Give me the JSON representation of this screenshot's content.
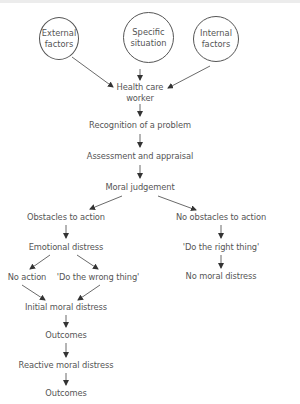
{
  "diagram": {
    "type": "flowchart",
    "colors": {
      "text": "#555555",
      "arrow": "#333333",
      "circle_border": "#555555"
    },
    "input_circles": [
      {
        "id": "external",
        "line1": "External",
        "line2": "factors"
      },
      {
        "id": "specific",
        "line1": "Specific",
        "line2": "situation"
      },
      {
        "id": "internal",
        "line1": "Internal",
        "line2": "factors"
      }
    ],
    "nodes": {
      "health_care_worker": {
        "line1": "Health care",
        "line2": "worker"
      },
      "recognition": "Recognition of a problem",
      "assessment": "Assessment and appraisal",
      "moral_judgement": "Moral judgement",
      "obstacles": "Obstacles to action",
      "no_obstacles": "No obstacles to action",
      "emotional_distress": "Emotional distress",
      "right_thing": "'Do the right thing'",
      "no_moral_distress": "No moral distress",
      "no_action": "No action",
      "wrong_thing": "'Do the wrong thing'",
      "initial_distress": "Initial moral distress",
      "outcomes_1": "Outcomes",
      "reactive_distress": "Reactive moral distress",
      "outcomes_2": "Outcomes"
    }
  }
}
